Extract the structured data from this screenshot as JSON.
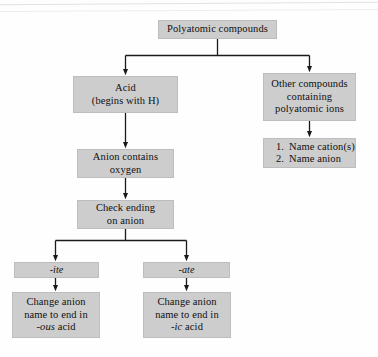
{
  "diagram": {
    "box_fill": "#cdcdcd",
    "box_border": "#bdbdbd",
    "background": "#fefefe",
    "connector_color": "#1a1a1a"
  },
  "nodes": {
    "root": {
      "label": "Polyatomic compounds"
    },
    "acid": {
      "line1": "Acid",
      "line2": "(begins with H)"
    },
    "other": {
      "line1": "Other compounds",
      "line2": "containing",
      "line3": "polyatomic ions"
    },
    "steps": {
      "item1_num": "1.",
      "item1_text": "Name cation(s)",
      "item2_num": "2.",
      "item2_text": "Name anion"
    },
    "anion_oxygen": {
      "line1": "Anion contains",
      "line2": "oxygen"
    },
    "check_ending": {
      "line1": "Check ending",
      "line2": "on anion"
    },
    "ite": {
      "label": "-ite"
    },
    "ate": {
      "label": "-ate"
    },
    "ous_acid": {
      "line1": "Change anion",
      "line2": "name to end in",
      "line3_suffix": "-ous",
      "line3_rest": " acid"
    },
    "ic_acid": {
      "line1": "Change anion",
      "line2": "name to end in",
      "line3_suffix": "-ic",
      "line3_rest": " acid"
    }
  }
}
